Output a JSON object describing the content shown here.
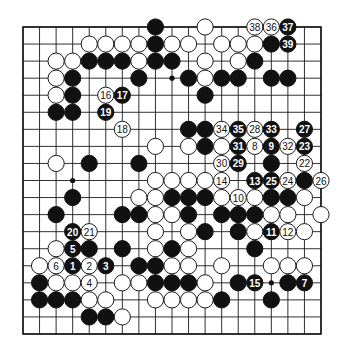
{
  "diagram": {
    "type": "go-board",
    "size": 19,
    "colors": {
      "black": "#111111",
      "white": "#ffffff",
      "line": "#1a1a1a"
    },
    "markers": [
      {
        "row": 3,
        "col": 9
      },
      {
        "row": 9,
        "col": 3
      },
      {
        "row": 15,
        "col": 15
      }
    ],
    "stones": [
      {
        "row": 0,
        "col": 8,
        "color": "black",
        "label": ""
      },
      {
        "row": 0,
        "col": 11,
        "color": "white",
        "label": ""
      },
      {
        "row": 0,
        "col": 14,
        "color": "white",
        "label": "38"
      },
      {
        "row": 0,
        "col": 15,
        "color": "white",
        "label": "36"
      },
      {
        "row": 0,
        "col": 16,
        "color": "black",
        "label": "37"
      },
      {
        "row": 1,
        "col": 4,
        "color": "white",
        "label": ""
      },
      {
        "row": 1,
        "col": 5,
        "color": "white",
        "label": ""
      },
      {
        "row": 1,
        "col": 6,
        "color": "white",
        "label": ""
      },
      {
        "row": 1,
        "col": 7,
        "color": "white",
        "label": ""
      },
      {
        "row": 1,
        "col": 8,
        "color": "black",
        "label": ""
      },
      {
        "row": 1,
        "col": 9,
        "color": "white",
        "label": ""
      },
      {
        "row": 1,
        "col": 10,
        "color": "white",
        "label": ""
      },
      {
        "row": 1,
        "col": 12,
        "color": "white",
        "label": ""
      },
      {
        "row": 1,
        "col": 13,
        "color": "white",
        "label": ""
      },
      {
        "row": 1,
        "col": 14,
        "color": "white",
        "label": ""
      },
      {
        "row": 1,
        "col": 15,
        "color": "black",
        "label": ""
      },
      {
        "row": 1,
        "col": 16,
        "color": "black",
        "label": "39"
      },
      {
        "row": 2,
        "col": 2,
        "color": "white",
        "label": ""
      },
      {
        "row": 2,
        "col": 3,
        "color": "white",
        "label": ""
      },
      {
        "row": 2,
        "col": 4,
        "color": "black",
        "label": ""
      },
      {
        "row": 2,
        "col": 5,
        "color": "black",
        "label": ""
      },
      {
        "row": 2,
        "col": 6,
        "color": "black",
        "label": ""
      },
      {
        "row": 2,
        "col": 7,
        "color": "white",
        "label": ""
      },
      {
        "row": 2,
        "col": 8,
        "color": "black",
        "label": ""
      },
      {
        "row": 2,
        "col": 9,
        "color": "black",
        "label": ""
      },
      {
        "row": 2,
        "col": 11,
        "color": "white",
        "label": ""
      },
      {
        "row": 2,
        "col": 13,
        "color": "white",
        "label": ""
      },
      {
        "row": 2,
        "col": 14,
        "color": "black",
        "label": ""
      },
      {
        "row": 3,
        "col": 2,
        "color": "white",
        "label": ""
      },
      {
        "row": 3,
        "col": 3,
        "color": "black",
        "label": ""
      },
      {
        "row": 3,
        "col": 7,
        "color": "black",
        "label": ""
      },
      {
        "row": 3,
        "col": 10,
        "color": "black",
        "label": ""
      },
      {
        "row": 3,
        "col": 11,
        "color": "white",
        "label": ""
      },
      {
        "row": 3,
        "col": 12,
        "color": "black",
        "label": ""
      },
      {
        "row": 3,
        "col": 13,
        "color": "black",
        "label": ""
      },
      {
        "row": 3,
        "col": 15,
        "color": "black",
        "label": ""
      },
      {
        "row": 3,
        "col": 16,
        "color": "black",
        "label": ""
      },
      {
        "row": 4,
        "col": 2,
        "color": "white",
        "label": ""
      },
      {
        "row": 4,
        "col": 3,
        "color": "black",
        "label": ""
      },
      {
        "row": 4,
        "col": 5,
        "color": "white",
        "label": "16"
      },
      {
        "row": 4,
        "col": 6,
        "color": "black",
        "label": "17"
      },
      {
        "row": 4,
        "col": 11,
        "color": "black",
        "label": ""
      },
      {
        "row": 5,
        "col": 2,
        "color": "black",
        "label": ""
      },
      {
        "row": 5,
        "col": 3,
        "color": "black",
        "label": ""
      },
      {
        "row": 5,
        "col": 5,
        "color": "black",
        "label": "19"
      },
      {
        "row": 6,
        "col": 6,
        "color": "white",
        "label": "18"
      },
      {
        "row": 6,
        "col": 10,
        "color": "black",
        "label": ""
      },
      {
        "row": 6,
        "col": 11,
        "color": "black",
        "label": ""
      },
      {
        "row": 6,
        "col": 12,
        "color": "white",
        "label": "34"
      },
      {
        "row": 6,
        "col": 13,
        "color": "black",
        "label": "35"
      },
      {
        "row": 6,
        "col": 14,
        "color": "white",
        "label": "28"
      },
      {
        "row": 6,
        "col": 15,
        "color": "black",
        "label": "33"
      },
      {
        "row": 6,
        "col": 17,
        "color": "black",
        "label": "27"
      },
      {
        "row": 7,
        "col": 8,
        "color": "white",
        "label": ""
      },
      {
        "row": 7,
        "col": 10,
        "color": "white",
        "label": ""
      },
      {
        "row": 7,
        "col": 11,
        "color": "black",
        "label": ""
      },
      {
        "row": 7,
        "col": 12,
        "color": "white",
        "label": ""
      },
      {
        "row": 7,
        "col": 13,
        "color": "black",
        "label": "31"
      },
      {
        "row": 7,
        "col": 14,
        "color": "white",
        "label": "8"
      },
      {
        "row": 7,
        "col": 15,
        "color": "black",
        "label": "9"
      },
      {
        "row": 7,
        "col": 16,
        "color": "white",
        "label": "32"
      },
      {
        "row": 7,
        "col": 17,
        "color": "black",
        "label": "23"
      },
      {
        "row": 8,
        "col": 2,
        "color": "white",
        "label": ""
      },
      {
        "row": 8,
        "col": 4,
        "color": "black",
        "label": ""
      },
      {
        "row": 8,
        "col": 7,
        "color": "black",
        "label": ""
      },
      {
        "row": 8,
        "col": 12,
        "color": "white",
        "label": "30"
      },
      {
        "row": 8,
        "col": 13,
        "color": "black",
        "label": "29"
      },
      {
        "row": 8,
        "col": 15,
        "color": "black",
        "label": ""
      },
      {
        "row": 8,
        "col": 17,
        "color": "white",
        "label": "22"
      },
      {
        "row": 9,
        "col": 8,
        "color": "white",
        "label": ""
      },
      {
        "row": 9,
        "col": 9,
        "color": "white",
        "label": ""
      },
      {
        "row": 9,
        "col": 10,
        "color": "white",
        "label": ""
      },
      {
        "row": 9,
        "col": 11,
        "color": "white",
        "label": ""
      },
      {
        "row": 9,
        "col": 12,
        "color": "white",
        "label": "14"
      },
      {
        "row": 9,
        "col": 14,
        "color": "black",
        "label": "13"
      },
      {
        "row": 9,
        "col": 15,
        "color": "black",
        "label": "25"
      },
      {
        "row": 9,
        "col": 16,
        "color": "white",
        "label": "24"
      },
      {
        "row": 9,
        "col": 17,
        "color": "black",
        "label": ""
      },
      {
        "row": 9,
        "col": 18,
        "color": "white",
        "label": "26"
      },
      {
        "row": 10,
        "col": 3,
        "color": "black",
        "label": ""
      },
      {
        "row": 10,
        "col": 7,
        "color": "white",
        "label": ""
      },
      {
        "row": 10,
        "col": 8,
        "color": "white",
        "label": ""
      },
      {
        "row": 10,
        "col": 9,
        "color": "black",
        "label": ""
      },
      {
        "row": 10,
        "col": 10,
        "color": "black",
        "label": ""
      },
      {
        "row": 10,
        "col": 11,
        "color": "black",
        "label": ""
      },
      {
        "row": 10,
        "col": 12,
        "color": "white",
        "label": ""
      },
      {
        "row": 10,
        "col": 13,
        "color": "white",
        "label": "10"
      },
      {
        "row": 10,
        "col": 14,
        "color": "white",
        "label": ""
      },
      {
        "row": 10,
        "col": 15,
        "color": "black",
        "label": ""
      },
      {
        "row": 10,
        "col": 16,
        "color": "black",
        "label": ""
      },
      {
        "row": 10,
        "col": 17,
        "color": "white",
        "label": ""
      },
      {
        "row": 11,
        "col": 2,
        "color": "black",
        "label": ""
      },
      {
        "row": 11,
        "col": 6,
        "color": "black",
        "label": ""
      },
      {
        "row": 11,
        "col": 7,
        "color": "black",
        "label": ""
      },
      {
        "row": 11,
        "col": 8,
        "color": "white",
        "label": ""
      },
      {
        "row": 11,
        "col": 9,
        "color": "white",
        "label": ""
      },
      {
        "row": 11,
        "col": 10,
        "color": "black",
        "label": ""
      },
      {
        "row": 11,
        "col": 12,
        "color": "black",
        "label": ""
      },
      {
        "row": 11,
        "col": 13,
        "color": "black",
        "label": ""
      },
      {
        "row": 11,
        "col": 14,
        "color": "black",
        "label": ""
      },
      {
        "row": 11,
        "col": 15,
        "color": "white",
        "label": ""
      },
      {
        "row": 11,
        "col": 16,
        "color": "white",
        "label": ""
      },
      {
        "row": 11,
        "col": 18,
        "color": "white",
        "label": ""
      },
      {
        "row": 12,
        "col": 3,
        "color": "black",
        "label": "20"
      },
      {
        "row": 12,
        "col": 4,
        "color": "white",
        "label": "21"
      },
      {
        "row": 12,
        "col": 8,
        "color": "white",
        "label": ""
      },
      {
        "row": 12,
        "col": 10,
        "color": "white",
        "label": ""
      },
      {
        "row": 12,
        "col": 11,
        "color": "black",
        "label": ""
      },
      {
        "row": 12,
        "col": 13,
        "color": "black",
        "label": ""
      },
      {
        "row": 12,
        "col": 14,
        "color": "white",
        "label": ""
      },
      {
        "row": 12,
        "col": 15,
        "color": "black",
        "label": "11"
      },
      {
        "row": 12,
        "col": 16,
        "color": "white",
        "label": "12"
      },
      {
        "row": 12,
        "col": 17,
        "color": "white",
        "label": ""
      },
      {
        "row": 13,
        "col": 2,
        "color": "white",
        "label": ""
      },
      {
        "row": 13,
        "col": 3,
        "color": "black",
        "label": "5"
      },
      {
        "row": 13,
        "col": 4,
        "color": "black",
        "label": ""
      },
      {
        "row": 13,
        "col": 6,
        "color": "black",
        "label": ""
      },
      {
        "row": 13,
        "col": 8,
        "color": "white",
        "label": ""
      },
      {
        "row": 13,
        "col": 9,
        "color": "black",
        "label": ""
      },
      {
        "row": 13,
        "col": 10,
        "color": "white",
        "label": ""
      },
      {
        "row": 13,
        "col": 14,
        "color": "black",
        "label": ""
      },
      {
        "row": 14,
        "col": 1,
        "color": "white",
        "label": ""
      },
      {
        "row": 14,
        "col": 2,
        "color": "white",
        "label": "6"
      },
      {
        "row": 14,
        "col": 3,
        "color": "black",
        "label": "1"
      },
      {
        "row": 14,
        "col": 4,
        "color": "white",
        "label": "2"
      },
      {
        "row": 14,
        "col": 5,
        "color": "black",
        "label": "3"
      },
      {
        "row": 14,
        "col": 7,
        "color": "black",
        "label": ""
      },
      {
        "row": 14,
        "col": 8,
        "color": "black",
        "label": ""
      },
      {
        "row": 14,
        "col": 9,
        "color": "white",
        "label": ""
      },
      {
        "row": 14,
        "col": 10,
        "color": "white",
        "label": ""
      },
      {
        "row": 14,
        "col": 12,
        "color": "white",
        "label": ""
      },
      {
        "row": 14,
        "col": 15,
        "color": "white",
        "label": ""
      },
      {
        "row": 14,
        "col": 16,
        "color": "white",
        "label": ""
      },
      {
        "row": 14,
        "col": 17,
        "color": "white",
        "label": ""
      },
      {
        "row": 15,
        "col": 1,
        "color": "black",
        "label": ""
      },
      {
        "row": 15,
        "col": 2,
        "color": "white",
        "label": ""
      },
      {
        "row": 15,
        "col": 3,
        "color": "white",
        "label": ""
      },
      {
        "row": 15,
        "col": 4,
        "color": "white",
        "label": "4"
      },
      {
        "row": 15,
        "col": 6,
        "color": "white",
        "label": ""
      },
      {
        "row": 15,
        "col": 7,
        "color": "white",
        "label": ""
      },
      {
        "row": 15,
        "col": 8,
        "color": "black",
        "label": ""
      },
      {
        "row": 15,
        "col": 9,
        "color": "black",
        "label": ""
      },
      {
        "row": 15,
        "col": 10,
        "color": "black",
        "label": ""
      },
      {
        "row": 15,
        "col": 11,
        "color": "white",
        "label": ""
      },
      {
        "row": 15,
        "col": 13,
        "color": "black",
        "label": ""
      },
      {
        "row": 15,
        "col": 14,
        "color": "black",
        "label": "15"
      },
      {
        "row": 15,
        "col": 16,
        "color": "black",
        "label": ""
      },
      {
        "row": 15,
        "col": 17,
        "color": "black",
        "label": "7"
      },
      {
        "row": 16,
        "col": 1,
        "color": "black",
        "label": ""
      },
      {
        "row": 16,
        "col": 2,
        "color": "black",
        "label": ""
      },
      {
        "row": 16,
        "col": 3,
        "color": "black",
        "label": ""
      },
      {
        "row": 16,
        "col": 4,
        "color": "white",
        "label": ""
      },
      {
        "row": 16,
        "col": 5,
        "color": "white",
        "label": ""
      },
      {
        "row": 16,
        "col": 8,
        "color": "white",
        "label": ""
      },
      {
        "row": 16,
        "col": 9,
        "color": "white",
        "label": ""
      },
      {
        "row": 16,
        "col": 10,
        "color": "white",
        "label": ""
      },
      {
        "row": 16,
        "col": 11,
        "color": "white",
        "label": ""
      },
      {
        "row": 16,
        "col": 12,
        "color": "black",
        "label": ""
      },
      {
        "row": 16,
        "col": 15,
        "color": "black",
        "label": ""
      },
      {
        "row": 17,
        "col": 4,
        "color": "black",
        "label": ""
      },
      {
        "row": 17,
        "col": 5,
        "color": "black",
        "label": ""
      },
      {
        "row": 17,
        "col": 6,
        "color": "white",
        "label": ""
      }
    ]
  }
}
